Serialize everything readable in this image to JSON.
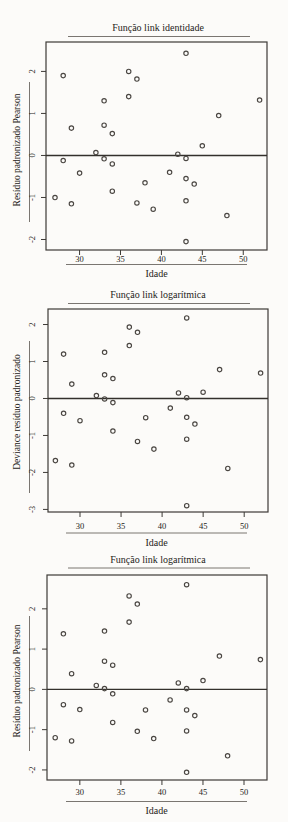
{
  "figure": {
    "description_labels": {
      "x_axis": "Idade"
    }
  },
  "colors": {
    "background": "#fcfbf9",
    "axis": "#3d3a36",
    "reference_line": "#33302c",
    "point_stroke": "#4a4642",
    "underline": "#7a7671",
    "text": "#262320"
  },
  "chart_data": [
    {
      "type": "scatter",
      "title": "Função link identidade",
      "xlabel": "Idade",
      "ylabel": "Resíduo padronizado Pearson",
      "x_ticks": [
        30,
        35,
        40,
        45,
        50
      ],
      "y_ticks": [
        -2,
        -1,
        0,
        1,
        2
      ],
      "xlim": [
        25.9,
        52.9
      ],
      "ylim": [
        -2.25,
        2.7
      ],
      "refline_y": 0,
      "grid": false,
      "legend": "none",
      "marker": "open-circle",
      "points": [
        [
          27,
          -1.0
        ],
        [
          28,
          1.9
        ],
        [
          28,
          -0.12
        ],
        [
          29,
          0.65
        ],
        [
          29,
          -1.15
        ],
        [
          30,
          -0.42
        ],
        [
          32,
          0.07
        ],
        [
          33,
          1.3
        ],
        [
          33,
          0.72
        ],
        [
          33,
          -0.08
        ],
        [
          34,
          0.52
        ],
        [
          34,
          -0.2
        ],
        [
          34,
          -0.85
        ],
        [
          36,
          2.0
        ],
        [
          36,
          1.4
        ],
        [
          37,
          1.82
        ],
        [
          37,
          -1.13
        ],
        [
          38,
          -0.65
        ],
        [
          39,
          -1.28
        ],
        [
          41,
          -0.4
        ],
        [
          42,
          0.03
        ],
        [
          43,
          2.43
        ],
        [
          43,
          -0.07
        ],
        [
          43,
          -0.55
        ],
        [
          43,
          -1.08
        ],
        [
          43,
          -2.05
        ],
        [
          44,
          -0.68
        ],
        [
          45,
          0.23
        ],
        [
          47,
          0.95
        ],
        [
          48,
          -1.43
        ],
        [
          52,
          1.32
        ]
      ]
    },
    {
      "type": "scatter",
      "title": "Função link logarítmica",
      "xlabel": "Idade",
      "ylabel": "Deviance resíduo padronizado",
      "x_ticks": [
        30,
        35,
        40,
        45,
        50
      ],
      "y_ticks": [
        -3,
        -2,
        -1,
        0,
        1,
        2
      ],
      "xlim": [
        26.1,
        52.9
      ],
      "ylim": [
        -3.07,
        2.42
      ],
      "refline_y": 0,
      "grid": false,
      "legend": "none",
      "marker": "open-circle",
      "points": [
        [
          27,
          -1.68
        ],
        [
          28,
          1.2
        ],
        [
          28,
          -0.4
        ],
        [
          29,
          0.39
        ],
        [
          29,
          -1.8
        ],
        [
          30,
          -0.6
        ],
        [
          32,
          0.08
        ],
        [
          33,
          1.25
        ],
        [
          33,
          0.64
        ],
        [
          33,
          -0.01
        ],
        [
          34,
          0.54
        ],
        [
          34,
          -0.11
        ],
        [
          34,
          -0.88
        ],
        [
          36,
          1.93
        ],
        [
          36,
          1.43
        ],
        [
          37,
          1.79
        ],
        [
          37,
          -1.16
        ],
        [
          38,
          -0.52
        ],
        [
          39,
          -1.37
        ],
        [
          41,
          -0.26
        ],
        [
          42,
          0.15
        ],
        [
          43,
          2.18
        ],
        [
          43,
          0.02
        ],
        [
          43,
          -0.51
        ],
        [
          43,
          -1.1
        ],
        [
          43,
          -2.9
        ],
        [
          44,
          -0.69
        ],
        [
          45,
          0.17
        ],
        [
          47,
          0.78
        ],
        [
          48,
          -1.89
        ],
        [
          52,
          0.69
        ]
      ]
    },
    {
      "type": "scatter",
      "title": "Função link logarítmica",
      "xlabel": "Idade",
      "ylabel": "Resíduo padronizado Pearson",
      "x_ticks": [
        30,
        35,
        40,
        45,
        50
      ],
      "y_ticks": [
        -2,
        -1,
        0,
        1,
        2
      ],
      "xlim": [
        26.0,
        52.8
      ],
      "ylim": [
        -2.25,
        2.84
      ],
      "refline_y": 0,
      "grid": false,
      "legend": "none",
      "marker": "open-circle",
      "points": [
        [
          27,
          -1.2
        ],
        [
          28,
          1.38
        ],
        [
          28,
          -0.38
        ],
        [
          29,
          0.39
        ],
        [
          29,
          -1.28
        ],
        [
          30,
          -0.5
        ],
        [
          32,
          0.1
        ],
        [
          33,
          1.45
        ],
        [
          33,
          0.7
        ],
        [
          33,
          0.02
        ],
        [
          34,
          0.6
        ],
        [
          34,
          -0.11
        ],
        [
          34,
          -0.82
        ],
        [
          36,
          2.32
        ],
        [
          36,
          1.67
        ],
        [
          37,
          2.12
        ],
        [
          37,
          -1.04
        ],
        [
          38,
          -0.51
        ],
        [
          39,
          -1.22
        ],
        [
          41,
          -0.26
        ],
        [
          42,
          0.16
        ],
        [
          43,
          2.6
        ],
        [
          43,
          0.02
        ],
        [
          43,
          -0.51
        ],
        [
          43,
          -1.03
        ],
        [
          43,
          -2.06
        ],
        [
          44,
          -0.65
        ],
        [
          45,
          0.22
        ],
        [
          47,
          0.83
        ],
        [
          48,
          -1.65
        ],
        [
          52,
          0.74
        ]
      ]
    }
  ]
}
